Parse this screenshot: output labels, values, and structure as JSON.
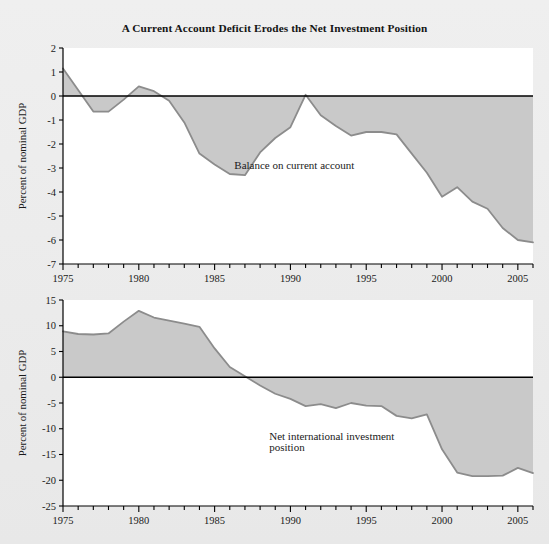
{
  "figure": {
    "title": "A Current Account Deficit Erodes the Net Investment Position",
    "background_color": "#ebebeb",
    "plot_background_color": "#ffffff",
    "area_fill_color": "#c9c9c9",
    "line_color": "#8c8c8c",
    "zero_line_color": "#000000",
    "axis_color": "#000000"
  },
  "chart_data": [
    {
      "id": "current-account",
      "type": "area",
      "title": "",
      "xlabel": "",
      "ylabel": "Percent of nominal GDP",
      "xlim": [
        1975,
        2006
      ],
      "ylim": [
        -7,
        2
      ],
      "grid": false,
      "legend": "none",
      "zero_line": 0,
      "annotations": [
        {
          "text": "Balance on current account",
          "x": 1986.3,
          "y": -3.05
        }
      ],
      "xticks_major": [
        1975,
        1980,
        1985,
        1990,
        1995,
        2000,
        2005
      ],
      "xtick_labels": [
        "1975",
        "1980",
        "1985",
        "1990",
        "1995",
        "2000",
        "2005"
      ],
      "xticks_minor_step": 1,
      "yticks": [
        2,
        1,
        0,
        -1,
        -2,
        -3,
        -4,
        -5,
        -6,
        -7
      ],
      "ytick_labels": [
        "2",
        "1",
        "0",
        "-1",
        "-2",
        "-3",
        "-4",
        "-5",
        "-6",
        "-7"
      ],
      "series": [
        {
          "name": "Balance on current account",
          "x": [
            1975,
            1976,
            1977,
            1978,
            1979,
            1980,
            1981,
            1982,
            1983,
            1984,
            1985,
            1986,
            1987,
            1988,
            1989,
            1990,
            1991,
            1992,
            1993,
            1994,
            1995,
            1996,
            1997,
            1998,
            1999,
            2000,
            2001,
            2002,
            2003,
            2004,
            2005,
            2006
          ],
          "values": [
            1.15,
            0.25,
            -0.65,
            -0.65,
            -0.15,
            0.4,
            0.2,
            -0.2,
            -1.1,
            -2.4,
            -2.85,
            -3.25,
            -3.3,
            -2.35,
            -1.75,
            -1.3,
            0.05,
            -0.8,
            -1.25,
            -1.65,
            -1.5,
            -1.5,
            -1.6,
            -2.4,
            -3.2,
            -4.2,
            -3.8,
            -4.4,
            -4.7,
            -5.5,
            -6.0,
            -6.1
          ]
        }
      ]
    },
    {
      "id": "net-investment-position",
      "type": "area",
      "title": "",
      "xlabel": "",
      "ylabel": "Percent of nominal GDP",
      "xlim": [
        1975,
        2006
      ],
      "ylim": [
        -25,
        15
      ],
      "grid": false,
      "legend": "none",
      "zero_line": 0,
      "annotations": [
        {
          "text": "Net international investment",
          "x": 1988.6,
          "y": -12.2
        },
        {
          "text": "position",
          "x": 1988.6,
          "y": -14.3
        }
      ],
      "xticks_major": [
        1975,
        1980,
        1985,
        1990,
        1995,
        2000,
        2005
      ],
      "xtick_labels": [
        "1975",
        "1980",
        "1985",
        "1990",
        "1995",
        "2000",
        "2005"
      ],
      "xticks_minor_step": 1,
      "yticks": [
        15,
        10,
        5,
        0,
        -5,
        -10,
        -15,
        -20,
        -25
      ],
      "ytick_labels": [
        "15",
        "10",
        "5",
        "0",
        "-5",
        "-10",
        "-15",
        "-20",
        "-25"
      ],
      "series": [
        {
          "name": "Net international investment position",
          "x": [
            1975,
            1976,
            1977,
            1978,
            1979,
            1980,
            1981,
            1982,
            1983,
            1984,
            1985,
            1986,
            1987,
            1988,
            1989,
            1990,
            1991,
            1992,
            1993,
            1994,
            1995,
            1996,
            1997,
            1998,
            1999,
            2000,
            2001,
            2002,
            2003,
            2004,
            2005,
            2006
          ],
          "values": [
            8.9,
            8.4,
            8.3,
            8.5,
            10.8,
            12.9,
            11.6,
            11.0,
            10.4,
            9.8,
            5.6,
            2.0,
            0.2,
            -1.6,
            -3.2,
            -4.2,
            -5.6,
            -5.2,
            -6.0,
            -5.0,
            -5.5,
            -5.6,
            -7.5,
            -8.0,
            -7.2,
            -14.0,
            -18.5,
            -19.2,
            -19.2,
            -19.1,
            -17.6,
            -18.6
          ]
        }
      ]
    }
  ]
}
